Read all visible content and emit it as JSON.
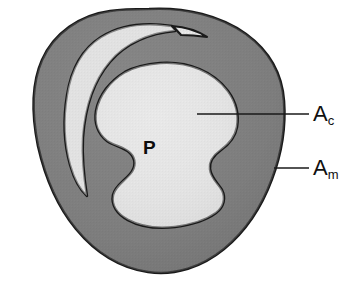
{
  "figure": {
    "type": "anatomical-cross-section-diagram",
    "background_color": "#ffffff"
  },
  "colors": {
    "media_fill": "#7d7d7d",
    "lumen_fill": "#e2e2e2",
    "crescent_fill": "#dcdcdc",
    "outline": "#1a1a1a",
    "label_color": "#101010",
    "leader_line_color": "#1a1a1a"
  },
  "regions": [
    {
      "id": "media-outer",
      "name": "tunica-media-outer-ring",
      "fill_color": "#7d7d7d",
      "description": "Outer dark gray vessel wall ring"
    },
    {
      "id": "crescent",
      "name": "upper-left-crescent-lumen",
      "fill_color": "#dcdcdc",
      "description": "Light crescent-shaped channel in upper left"
    },
    {
      "id": "plaque-core",
      "name": "plaque-core-area",
      "fill_color": "#e2e2e2",
      "description": "Large light central lobed plaque region"
    }
  ],
  "labels": {
    "plaque": {
      "text": "P",
      "name": "plaque-label",
      "x": 146,
      "y": 148
    },
    "ac": {
      "base": "A",
      "sub": "c",
      "name": "area-core-label",
      "x": 313,
      "y": 103,
      "meaning": "core area"
    },
    "am": {
      "base": "A",
      "sub": "m",
      "name": "area-media-label",
      "x": 313,
      "y": 157,
      "meaning": "media area"
    }
  },
  "leader_lines": [
    {
      "name": "leader-line-ac",
      "from": [
        197,
        114
      ],
      "to": [
        308,
        114
      ],
      "target": "plaque-core-area"
    },
    {
      "name": "leader-line-am",
      "from": [
        274,
        168
      ],
      "to": [
        308,
        168
      ],
      "target": "tunica-media-outer-ring"
    }
  ]
}
